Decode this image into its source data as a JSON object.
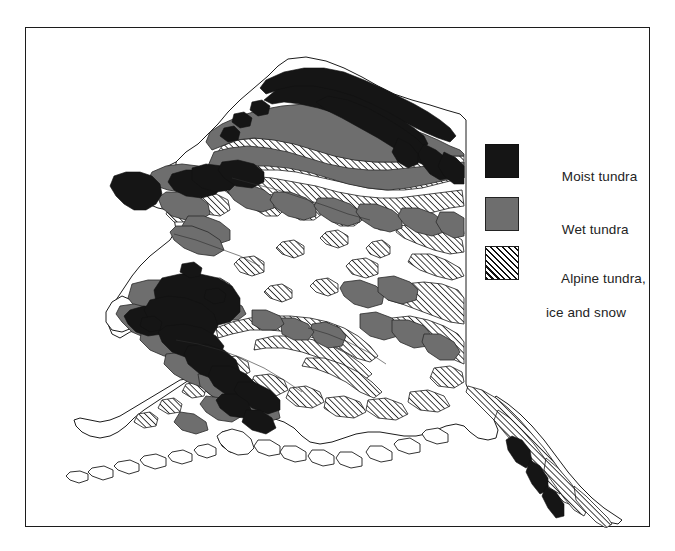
{
  "figure": {
    "kind": "thematic-map",
    "background_color": "#ffffff",
    "frame_color": "#1c1c1c"
  },
  "map": {
    "region": "Alaska",
    "outline_color": "#1c1c1c",
    "land_fill": "#ffffff",
    "classes": [
      {
        "id": "moist-tundra",
        "fill": "#151515",
        "pattern": "solid-black"
      },
      {
        "id": "wet-tundra",
        "fill": "#6e6e6e",
        "pattern": "solid-gray"
      },
      {
        "id": "alpine-tundra",
        "fill": "#ffffff",
        "pattern": "diagonal-hatch"
      }
    ]
  },
  "legend": {
    "entries": [
      {
        "swatch": "moist-tundra",
        "swatch_color": "#151515",
        "line_1": "Moist tundra",
        "line_2": ""
      },
      {
        "swatch": "wet-tundra",
        "swatch_color": "#6e6e6e",
        "line_1": "Wet tundra",
        "line_2": ""
      },
      {
        "swatch": "alpine-tundra",
        "swatch_color": "#ffffff",
        "line_1": "Alpine tundra,",
        "line_2": "ice and snow"
      }
    ]
  }
}
